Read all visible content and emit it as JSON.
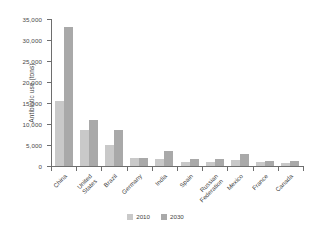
{
  "chart_data": {
    "type": "bar",
    "title": "",
    "xlabel": "",
    "ylabel": "Antibiotic use (tons)",
    "ylim": [
      0,
      35000
    ],
    "ytick_labels": [
      "35,000",
      "30,000",
      "25,000",
      "20,000",
      "15,000",
      "10,000",
      "5,000",
      "0"
    ],
    "ytick_values": [
      35000,
      30000,
      25000,
      20000,
      15000,
      10000,
      5000,
      0
    ],
    "grid": false,
    "legend_position": "bottom",
    "categories": [
      "China",
      "United States",
      "Brazil",
      "Germany",
      "India",
      "Spain",
      "Russian Federation",
      "Mexico",
      "France",
      "Canada"
    ],
    "series": [
      {
        "name": "2010",
        "color": "#c9c9c9",
        "values": [
          15500,
          8500,
          5000,
          1800,
          1600,
          1000,
          1000,
          1400,
          900,
          800
        ]
      },
      {
        "name": "2030",
        "color": "#a9a9a9",
        "values": [
          33000,
          11000,
          8500,
          2000,
          3600,
          1600,
          1700,
          2800,
          1200,
          1100
        ]
      }
    ]
  },
  "legend": {
    "items": [
      {
        "label": "2010",
        "color": "#c9c9c9"
      },
      {
        "label": "2030",
        "color": "#a9a9a9"
      }
    ]
  }
}
